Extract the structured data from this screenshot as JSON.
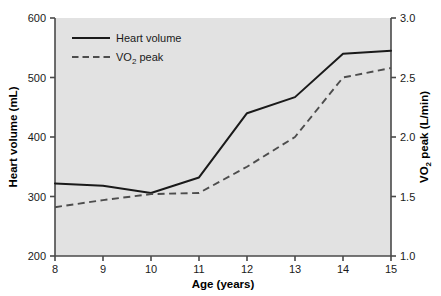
{
  "chart_data": {
    "type": "line",
    "title": "",
    "subtitle": "",
    "xlabel": "Age (years)",
    "ylabel": "Heart volume (mL)",
    "y2label": "VO2 peak (L/min)",
    "x": [
      8,
      9,
      10,
      11,
      12,
      13,
      14,
      15
    ],
    "xtick_labels": [
      "8",
      "9",
      "10",
      "11",
      "12",
      "13",
      "14",
      "15"
    ],
    "xlim": [
      8,
      15
    ],
    "ylim": [
      200,
      600
    ],
    "ytick_labels": [
      "200",
      "300",
      "400",
      "500",
      "600"
    ],
    "yticks": [
      200,
      300,
      400,
      500,
      600
    ],
    "y2lim": [
      1.0,
      3.0
    ],
    "y2tick_labels": [
      "1.0",
      "1.5",
      "2.0",
      "2.5",
      "3.0"
    ],
    "y2ticks": [
      1.0,
      1.5,
      2.0,
      2.5,
      3.0
    ],
    "grid": false,
    "legend_position": "upper-left-inside",
    "series": [
      {
        "name": "Heart volume",
        "axis": "left",
        "style": "solid",
        "color": "#1a1a1a",
        "values": [
          322,
          318,
          306,
          332,
          440,
          467,
          540,
          545
        ]
      },
      {
        "name": "VO2 peak",
        "axis": "right",
        "style": "dashed",
        "color": "#4d4d4d",
        "values": [
          1.41,
          1.47,
          1.52,
          1.53,
          1.75,
          2.0,
          2.5,
          2.58
        ]
      }
    ]
  },
  "axes": {
    "x_title": "Age (years)",
    "y_left_title": "Heart volume (mL)",
    "y_right_title_main": "VO",
    "y_right_title_sub": "2",
    "y_right_title_tail": " peak (L/min)"
  },
  "legend": {
    "items": [
      {
        "label": "Heart volume",
        "label_sub": "",
        "label_tail": ""
      },
      {
        "label": "VO",
        "label_sub": "2",
        "label_tail": " peak"
      }
    ]
  },
  "ticks": {
    "y_left": [
      "600",
      "500",
      "400",
      "300",
      "200"
    ],
    "y_right": [
      "3.0",
      "2.5",
      "2.0",
      "1.5",
      "1.0"
    ],
    "x": [
      "8",
      "9",
      "10",
      "11",
      "12",
      "13",
      "14",
      "15"
    ]
  },
  "colors": {
    "plot_background": "#e2e2e2",
    "axis": "#4a4a4a",
    "solid_line": "#1a1a1a",
    "dashed_line": "#4d4d4d",
    "text": "#1a1a1a",
    "page_background": "#ffffff"
  }
}
